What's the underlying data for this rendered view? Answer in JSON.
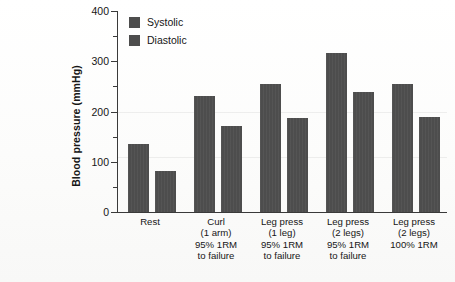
{
  "chart_data": {
    "type": "bar",
    "title": "",
    "xlabel": "",
    "ylabel": "Blood pressure (mmHg)",
    "ylim": [
      0,
      400
    ],
    "yticks": [
      0,
      100,
      200,
      300,
      400
    ],
    "yticks_minor": [
      50,
      150,
      250,
      350
    ],
    "grid": false,
    "legend_position": "top-left",
    "categories": [
      "Rest",
      "Curl\n(1 arm)\n95% 1RM\nto failure",
      "Leg press\n(1 leg)\n95% 1RM\nto failure",
      "Leg press\n(2 legs)\n95% 1RM\nto failure",
      "Leg press\n(2 legs)\n100% 1RM"
    ],
    "category_lines": [
      [
        "Rest"
      ],
      [
        "Curl",
        "(1 arm)",
        "95% 1RM",
        "to failure"
      ],
      [
        "Leg press",
        "(1 leg)",
        "95% 1RM",
        "to failure"
      ],
      [
        "Leg press",
        "(2 legs)",
        "95% 1RM",
        "to failure"
      ],
      [
        "Leg press",
        "(2 legs)",
        "100% 1RM"
      ]
    ],
    "series": [
      {
        "name": "Systolic",
        "values": [
          135,
          231,
          255,
          317,
          254
        ],
        "color": "#4d4d4d"
      },
      {
        "name": "Diastolic",
        "values": [
          82,
          172,
          188,
          238,
          190
        ],
        "color": "#4d4d4d"
      }
    ]
  },
  "legend": {
    "items": [
      {
        "label": "Systolic",
        "color": "#4d4d4d"
      },
      {
        "label": "Diastolic",
        "color": "#4d4d4d"
      }
    ]
  },
  "axis": {
    "y_title": "Blood pressure (mmHg)",
    "y_tick_labels": [
      "0",
      "100",
      "200",
      "300",
      "400"
    ]
  },
  "colors": {
    "bar": "#4d4d4d",
    "axis": "#3a3a3a",
    "text": "#161616",
    "background": "#fdfdfc"
  }
}
